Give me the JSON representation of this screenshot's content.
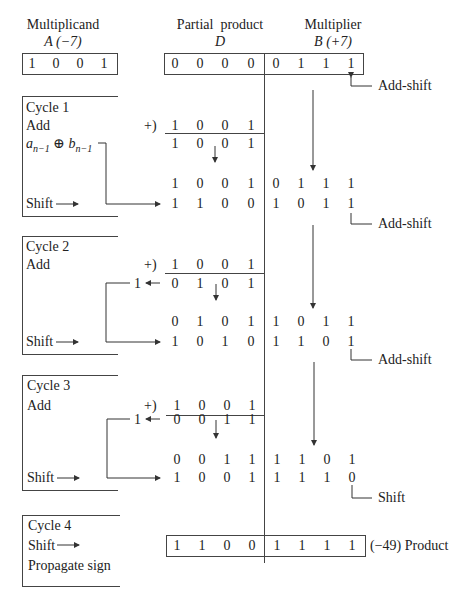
{
  "headers": {
    "multiplicand": "Multiplicand",
    "multiplicand_sub": "A (−7)",
    "partial_product": "Partial  product",
    "partial_product_sub": "D",
    "multiplier": "Multiplier",
    "multiplier_sub": "B (+7)"
  },
  "registers": {
    "A": [
      "1",
      "0",
      "0",
      "1"
    ],
    "D": [
      "0",
      "0",
      "0",
      "0"
    ],
    "B": [
      "0",
      "1",
      "1",
      "1"
    ]
  },
  "notes": {
    "n0": "Add-shift",
    "n1": "Add-shift",
    "n2": "Add-shift",
    "n3": "Shift",
    "product": "(−49) Product"
  },
  "cycles": [
    {
      "title": "Cycle 1",
      "op1": "Add",
      "op2": "a",
      "shift": "Shift",
      "plus": "+)",
      "addend": [
        "1",
        "0",
        "0",
        "1"
      ],
      "sum": [
        "1",
        "0",
        "0",
        "1"
      ],
      "before": [
        "1",
        "0",
        "0",
        "1",
        "0",
        "1",
        "1",
        "1"
      ],
      "after": [
        "1",
        "1",
        "0",
        "0",
        "1",
        "0",
        "1",
        "1"
      ]
    },
    {
      "title": "Cycle 2",
      "op1": "Add",
      "shift": "Shift",
      "plus": "+)",
      "carry": "1",
      "addend": [
        "1",
        "0",
        "0",
        "1"
      ],
      "sum": [
        "0",
        "1",
        "0",
        "1"
      ],
      "before": [
        "0",
        "1",
        "0",
        "1",
        "1",
        "0",
        "1",
        "1"
      ],
      "after": [
        "1",
        "0",
        "1",
        "0",
        "1",
        "1",
        "0",
        "1"
      ]
    },
    {
      "title": "Cycle 3",
      "op1": "Add",
      "shift": "Shift",
      "plus": "+)",
      "carry": "1",
      "addend": [
        "1",
        "0",
        "0",
        "1"
      ],
      "sum": [
        "0",
        "0",
        "1",
        "1"
      ],
      "before": [
        "0",
        "0",
        "1",
        "1",
        "1",
        "1",
        "0",
        "1"
      ],
      "after": [
        "1",
        "0",
        "0",
        "1",
        "1",
        "1",
        "1",
        "0"
      ]
    },
    {
      "title": "Cycle 4",
      "op1": "Shift",
      "op2": "Propagate sign",
      "product": [
        "1",
        "1",
        "0",
        "0",
        "1",
        "1",
        "1",
        "1"
      ]
    }
  ]
}
